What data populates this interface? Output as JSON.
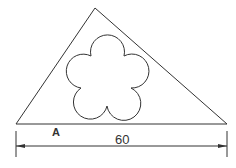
{
  "diagram": {
    "type": "geometry-figure",
    "shapes": {
      "triangle": {
        "vertices": [
          [
            16,
            124
          ],
          [
            95,
            8
          ],
          [
            227,
            124
          ]
        ]
      },
      "flower": {
        "petals": 5,
        "center": [
          106,
          80
        ]
      }
    },
    "labels": {
      "point": "A",
      "dimension": "60"
    },
    "colors": {
      "stroke": "#333333",
      "background": "#ffffff"
    }
  }
}
